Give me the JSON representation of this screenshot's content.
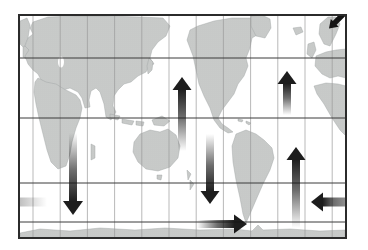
{
  "figure": {
    "kind": "world-map-circulation-figure",
    "projection_note": "world map with 30-degree graticule",
    "visible_text": []
  },
  "colors": {
    "background": "#ffffff",
    "ocean": "#ffffff",
    "land_dot": "#8f9392",
    "land_base": "#e9ebea",
    "grid_minor": "#9b9b9b",
    "grid_major": "#3a3a3a",
    "frame": "#2b2b2b",
    "arrow_dark": "#141414"
  },
  "map_frame": {
    "x": 19,
    "y": 15,
    "width": 327,
    "height": 223
  },
  "grid": {
    "vertical_x": [
      33,
      60.2,
      87.4,
      114.6,
      141.8,
      169,
      196.2,
      223.4,
      250.6,
      277.8,
      305,
      332.2
    ],
    "horizontal_y": [
      58,
      118,
      183,
      222
    ]
  },
  "arrows": [
    {
      "name": "norwegian-sea-sinking-arrow",
      "type": "solid-polygon",
      "region": "norwegian-sea",
      "points": "329,28.5 338.6,26.7 336.6,24.7 345.1,16.2 341.3,12.4 332.8,20.9 330.8,18.9"
    },
    {
      "name": "indian-ocean-downwelling-arrow",
      "type": "fade-arrow",
      "region": "indian-ocean",
      "direction": "down",
      "tip": [
        73,
        215
      ],
      "tail": [
        73,
        133
      ],
      "head_len": 14,
      "head_w": 20,
      "shaft_w": 8
    },
    {
      "name": "north-pacific-upwelling-arrow",
      "type": "fade-arrow",
      "region": "north-pacific",
      "direction": "up",
      "tip": [
        182,
        77
      ],
      "tail": [
        182,
        151
      ],
      "head_len": 13,
      "head_w": 19,
      "shaft_w": 8
    },
    {
      "name": "east-pacific-downwelling-arrow",
      "type": "fade-arrow",
      "region": "east-pacific",
      "direction": "down",
      "tip": [
        210,
        204
      ],
      "tail": [
        210,
        134
      ],
      "head_len": 13,
      "head_w": 19,
      "shaft_w": 8
    },
    {
      "name": "north-atlantic-upwelling-arrow",
      "type": "fade-arrow",
      "region": "north-atlantic",
      "direction": "up",
      "tip": [
        287,
        71
      ],
      "tail": [
        287,
        115
      ],
      "head_len": 13,
      "head_w": 19,
      "shaft_w": 8
    },
    {
      "name": "south-atlantic-upwelling-arrow",
      "type": "fade-arrow",
      "region": "south-atlantic",
      "direction": "up",
      "tip": [
        296,
        147
      ],
      "tail": [
        296,
        228
      ],
      "head_len": 13,
      "head_w": 19,
      "shaft_w": 8
    },
    {
      "name": "southern-ocean-eastward-arrow",
      "type": "fade-arrow",
      "region": "southern-ocean",
      "direction": "right",
      "tip": [
        247,
        224
      ],
      "tail": [
        197,
        224
      ],
      "head_len": 13,
      "head_w": 19,
      "shaft_w": 8
    },
    {
      "name": "south-atlantic-westward-arrow",
      "type": "fade-arrow",
      "region": "south-atlantic",
      "direction": "left",
      "tip": [
        311,
        202
      ],
      "tail": [
        347,
        202
      ],
      "head_len": 12,
      "head_w": 19,
      "shaft_w": 9,
      "tail_alpha": 0.45
    },
    {
      "name": "westward-arrow-continuation-band",
      "type": "band",
      "region": "south-ocean-left-edge",
      "rect": [
        19,
        197.5,
        28,
        9
      ],
      "from_alpha": 0.28
    }
  ]
}
